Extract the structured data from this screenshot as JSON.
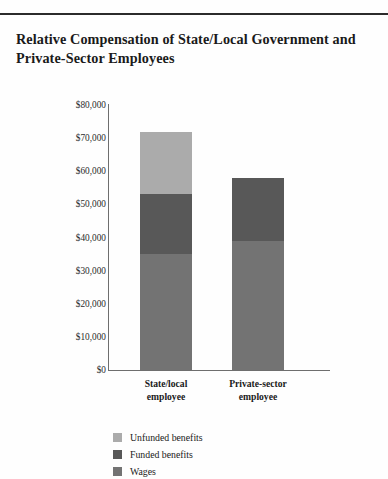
{
  "page": {
    "running_head": "",
    "title_line_1": "Relative Compensation of State/Local Government and",
    "title_line_2": "Private-Sector Employees"
  },
  "chart_data": {
    "type": "bar",
    "subtype": "stacked-bar",
    "title": "Relative Compensation of State/Local Government and Private-Sector Employees",
    "xlabel": "",
    "ylabel": "",
    "ylim": [
      0,
      80000
    ],
    "ytick_labels": [
      "$80,000",
      "$70,000",
      "$60,000",
      "$50,000",
      "$40,000",
      "$30,000",
      "$20,000",
      "$10,000",
      "$0"
    ],
    "ytick_values": [
      80000,
      70000,
      60000,
      50000,
      40000,
      30000,
      20000,
      10000,
      0
    ],
    "grid": false,
    "legend_position": "bottom-left",
    "categories": [
      "State/local employee",
      "Private-sector employee"
    ],
    "category_lines": [
      [
        "State/local",
        "employee"
      ],
      [
        "Private-sector",
        "employee"
      ]
    ],
    "series": [
      {
        "name": "Unfunded benefits",
        "color": "#ababab",
        "values": [
          19000,
          0
        ]
      },
      {
        "name": "Funded benefits",
        "color": "#585858",
        "values": [
          18000,
          19000
        ]
      },
      {
        "name": "Wages",
        "color": "#737373",
        "values": [
          35000,
          39000
        ]
      }
    ],
    "totals": [
      72000,
      58000
    ]
  },
  "legend": {
    "items": [
      {
        "label": "Unfunded benefits",
        "color": "#ababab"
      },
      {
        "label": "Funded benefits",
        "color": "#585858"
      },
      {
        "label": "Wages",
        "color": "#737373"
      }
    ]
  }
}
